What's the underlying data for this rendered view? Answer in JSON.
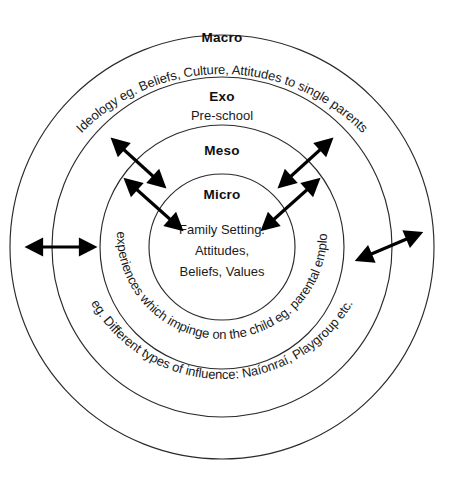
{
  "diagram": {
    "type": "concentric-circles",
    "background_color": "#ffffff",
    "stroke_color": "#2b2b2b",
    "text_color": "#1a1a1a",
    "center": {
      "x": 222,
      "y": 247
    },
    "rings": [
      {
        "id": "macro",
        "label": "Macro",
        "sublabel": "",
        "curved_text": "Ideology eg. Beliefs, Culture, Attitudes to single parents",
        "radius": 212,
        "label_y": 42
      },
      {
        "id": "exo",
        "label": "Exo",
        "sublabel": "Pre-school",
        "curved_text": "eg. Different types of influence: Naíonraí, Playgroup etc.",
        "radius": 170,
        "label_y": 101
      },
      {
        "id": "meso",
        "label": "Meso",
        "sublabel": "",
        "curved_text": "other experiences which impinge on the child eg. parental employment",
        "radius": 122,
        "label_y": 155
      },
      {
        "id": "micro",
        "label": "Micro",
        "sublabel": "",
        "curved_text": "",
        "radius": 73,
        "label_y": 199
      }
    ],
    "center_text": {
      "lines": [
        "Family Setting:",
        "Attitudes,",
        "Beliefs, Values"
      ]
    },
    "arrows": [
      {
        "id": "arrow-left-outer",
        "direction": "double",
        "orientation": "horizontal"
      },
      {
        "id": "arrow-right-outer",
        "direction": "double",
        "orientation": "diagonal"
      },
      {
        "id": "arrow-upper-left-outer",
        "direction": "double",
        "orientation": "diagonal"
      },
      {
        "id": "arrow-upper-left-inner",
        "direction": "double",
        "orientation": "diagonal"
      },
      {
        "id": "arrow-upper-right-outer",
        "direction": "double",
        "orientation": "diagonal"
      },
      {
        "id": "arrow-upper-right-inner",
        "direction": "double",
        "orientation": "diagonal"
      }
    ]
  }
}
